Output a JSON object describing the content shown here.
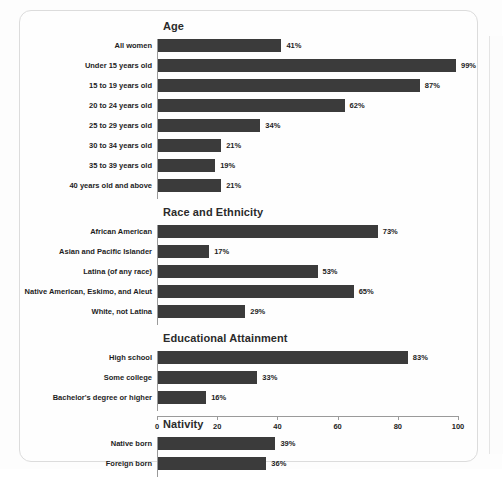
{
  "chart_data": {
    "type": "bar",
    "orientation": "horizontal",
    "title": "",
    "xlabel": "",
    "ylabel": "",
    "xlim": [
      0,
      100
    ],
    "xticks": [
      0,
      20,
      40,
      60,
      80,
      100
    ],
    "grid": false,
    "legend": false,
    "value_suffix": "%",
    "bar_color": "#3b3b3b",
    "sections": [
      {
        "title": "Age",
        "categories": [
          "All women",
          "Under 15 years old",
          "15 to 19 years old",
          "20 to 24 years old",
          "25 to 29 years old",
          "30 to 34 years old",
          "35 to 39 years old",
          "40 years old and above"
        ],
        "values": [
          41,
          99,
          87,
          62,
          34,
          21,
          19,
          21
        ],
        "labels": [
          "41%",
          "99%",
          "87%",
          "62%",
          "34%",
          "21%",
          "19%",
          "21%"
        ]
      },
      {
        "title": "Race and Ethnicity",
        "categories": [
          "African American",
          "Asian and Pacific Islander",
          "Latina (of any race)",
          "Native American, Eskimo, and Aleut",
          "White, not Latina"
        ],
        "values": [
          73,
          17,
          53,
          65,
          29
        ],
        "labels": [
          "73%",
          "17%",
          "53%",
          "65%",
          "29%"
        ]
      },
      {
        "title": "Educational Attainment",
        "categories": [
          "High school",
          "Some college",
          "Bachelor's degree or higher"
        ],
        "values": [
          83,
          33,
          16
        ],
        "labels": [
          "83%",
          "33%",
          "16%"
        ]
      },
      {
        "title": "Nativity",
        "categories": [
          "Native born",
          "Foreign born"
        ],
        "values": [
          39,
          36
        ],
        "labels": [
          "39%",
          "36%"
        ]
      }
    ]
  }
}
